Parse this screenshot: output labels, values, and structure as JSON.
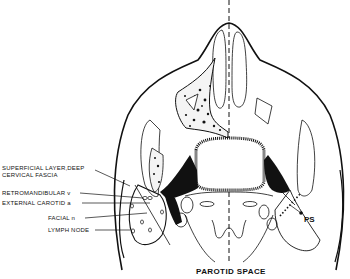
{
  "diagram": {
    "title": "PAROTID SPACE",
    "labels": {
      "superficial_layer_line1": "SUPERFICIAL LAYER,DEEP",
      "superficial_layer_line2": "CERVICAL FASCIA",
      "retromandibular": "RETROMANDIBULAR v",
      "external_carotid": "EXTERNAL CAROTID a",
      "facial": "FACIAL n",
      "lymph_node": "LYMPH NODE",
      "ps": "PS"
    },
    "colors": {
      "ink": "#111111",
      "background": "#ffffff"
    }
  }
}
